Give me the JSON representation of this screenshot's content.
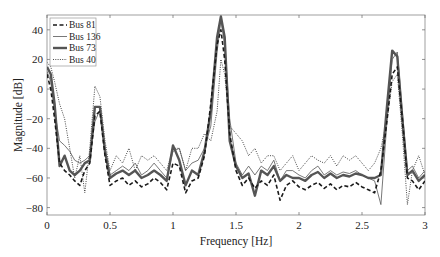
{
  "chart_data": {
    "type": "line",
    "title": "",
    "xlabel": "Frequency [Hz]",
    "ylabel": "Magnitude [dB]",
    "xlim": [
      0,
      3
    ],
    "ylim": [
      -85,
      50
    ],
    "xticks": [
      0,
      0.5,
      1,
      1.5,
      2,
      2.5,
      3
    ],
    "xtick_labels": [
      "0",
      "0.5",
      "1",
      "1.5",
      "2",
      "2.5",
      "3"
    ],
    "yticks": [
      40,
      20,
      0,
      -20,
      -40,
      -60,
      -80
    ],
    "ytick_labels": [
      "40",
      "20",
      "0",
      "-20",
      "-40",
      "-60",
      "-80"
    ],
    "grid": false,
    "legend_position": "upper left",
    "series": [
      {
        "name": "Bus 81",
        "style": "dashed",
        "color": "#1a1a1a",
        "x": [
          0,
          0.03,
          0.06,
          0.1,
          0.14,
          0.18,
          0.22,
          0.26,
          0.3,
          0.34,
          0.38,
          0.42,
          0.46,
          0.5,
          0.55,
          0.6,
          0.65,
          0.7,
          0.75,
          0.8,
          0.85,
          0.9,
          0.95,
          1.0,
          1.05,
          1.1,
          1.15,
          1.2,
          1.25,
          1.3,
          1.35,
          1.38,
          1.41,
          1.45,
          1.5,
          1.55,
          1.6,
          1.65,
          1.7,
          1.75,
          1.8,
          1.85,
          1.9,
          1.95,
          2.0,
          2.05,
          2.1,
          2.15,
          2.2,
          2.25,
          2.3,
          2.35,
          2.4,
          2.45,
          2.5,
          2.55,
          2.6,
          2.65,
          2.7,
          2.74,
          2.78,
          2.82,
          2.86,
          2.9,
          2.95,
          3.0
        ],
        "values": [
          10,
          0,
          -20,
          -50,
          -55,
          -58,
          -62,
          -65,
          -55,
          -50,
          -18,
          -15,
          -45,
          -65,
          -62,
          -60,
          -65,
          -62,
          -66,
          -64,
          -60,
          -63,
          -68,
          -50,
          -52,
          -70,
          -62,
          -60,
          -45,
          -10,
          30,
          40,
          20,
          -30,
          -55,
          -65,
          -60,
          -67,
          -62,
          -65,
          -58,
          -75,
          -65,
          -62,
          -66,
          -68,
          -65,
          -63,
          -67,
          -64,
          -68,
          -65,
          -66,
          -63,
          -66,
          -68,
          -70,
          -55,
          -20,
          10,
          15,
          -20,
          -60,
          -62,
          -68,
          -62
        ]
      },
      {
        "name": "Bus 136",
        "style": "solid-thin",
        "color": "#555555",
        "x": [
          0,
          0.03,
          0.06,
          0.1,
          0.14,
          0.18,
          0.22,
          0.26,
          0.3,
          0.34,
          0.38,
          0.42,
          0.46,
          0.5,
          0.55,
          0.6,
          0.65,
          0.7,
          0.75,
          0.8,
          0.85,
          0.9,
          0.95,
          1.0,
          1.05,
          1.1,
          1.15,
          1.2,
          1.25,
          1.3,
          1.35,
          1.38,
          1.41,
          1.45,
          1.5,
          1.55,
          1.6,
          1.65,
          1.7,
          1.75,
          1.8,
          1.85,
          1.9,
          1.95,
          2.0,
          2.05,
          2.1,
          2.15,
          2.2,
          2.25,
          2.3,
          2.35,
          2.4,
          2.45,
          2.5,
          2.55,
          2.6,
          2.65,
          2.7,
          2.74,
          2.78,
          2.82,
          2.86,
          2.9,
          2.95,
          3.0
        ],
        "values": [
          12,
          5,
          -15,
          -35,
          -38,
          -42,
          -48,
          -50,
          -48,
          -45,
          -22,
          -14,
          -40,
          -58,
          -55,
          -52,
          -55,
          -50,
          -58,
          -55,
          -50,
          -55,
          -60,
          -42,
          -40,
          -55,
          -50,
          -48,
          -40,
          -25,
          25,
          47,
          30,
          -20,
          -50,
          -58,
          -52,
          -58,
          -52,
          -55,
          -48,
          -62,
          -55,
          -55,
          -58,
          -60,
          -55,
          -52,
          -58,
          -55,
          -58,
          -56,
          -57,
          -55,
          -58,
          -60,
          -62,
          -78,
          -20,
          20,
          25,
          -15,
          -55,
          -52,
          -60,
          -55
        ]
      },
      {
        "name": "Bus 73",
        "style": "solid-thick",
        "color": "#555555",
        "x": [
          0,
          0.03,
          0.06,
          0.1,
          0.14,
          0.18,
          0.22,
          0.26,
          0.3,
          0.34,
          0.38,
          0.42,
          0.46,
          0.5,
          0.55,
          0.6,
          0.65,
          0.7,
          0.75,
          0.8,
          0.85,
          0.9,
          0.95,
          1.0,
          1.05,
          1.1,
          1.15,
          1.2,
          1.25,
          1.3,
          1.35,
          1.38,
          1.41,
          1.45,
          1.5,
          1.55,
          1.6,
          1.65,
          1.7,
          1.75,
          1.8,
          1.85,
          1.9,
          1.95,
          2.0,
          2.05,
          2.1,
          2.15,
          2.2,
          2.25,
          2.3,
          2.35,
          2.4,
          2.45,
          2.5,
          2.55,
          2.6,
          2.65,
          2.7,
          2.74,
          2.78,
          2.82,
          2.86,
          2.9,
          2.95,
          3.0
        ],
        "values": [
          15,
          10,
          -10,
          -52,
          -45,
          -55,
          -58,
          -55,
          -50,
          -48,
          -12,
          -12,
          -42,
          -60,
          -57,
          -55,
          -58,
          -55,
          -60,
          -58,
          -55,
          -58,
          -62,
          -38,
          -48,
          -65,
          -55,
          -58,
          -42,
          -15,
          35,
          49,
          35,
          -35,
          -52,
          -60,
          -57,
          -72,
          -55,
          -58,
          -52,
          -62,
          -58,
          -60,
          -60,
          -62,
          -58,
          -56,
          -60,
          -57,
          -60,
          -58,
          -59,
          -57,
          -58,
          -60,
          -60,
          -58,
          -10,
          26,
          22,
          -20,
          -58,
          -55,
          -62,
          -58
        ]
      },
      {
        "name": "Bus 40",
        "style": "dotted",
        "color": "#333333",
        "x": [
          0,
          0.03,
          0.06,
          0.1,
          0.14,
          0.18,
          0.22,
          0.26,
          0.3,
          0.34,
          0.38,
          0.42,
          0.46,
          0.5,
          0.55,
          0.6,
          0.65,
          0.7,
          0.75,
          0.8,
          0.85,
          0.9,
          0.95,
          1.0,
          1.05,
          1.1,
          1.15,
          1.2,
          1.25,
          1.3,
          1.35,
          1.38,
          1.41,
          1.45,
          1.5,
          1.55,
          1.6,
          1.65,
          1.7,
          1.75,
          1.8,
          1.85,
          1.9,
          1.95,
          2.0,
          2.05,
          2.1,
          2.15,
          2.2,
          2.25,
          2.3,
          2.35,
          2.4,
          2.45,
          2.5,
          2.55,
          2.6,
          2.65,
          2.7,
          2.74,
          2.78,
          2.82,
          2.86,
          2.9,
          2.95,
          3.0
        ],
        "values": [
          18,
          15,
          5,
          -10,
          -20,
          -40,
          -60,
          -45,
          -70,
          -40,
          2,
          -5,
          -35,
          -55,
          -45,
          -50,
          -40,
          -55,
          -45,
          -48,
          -45,
          -50,
          -55,
          -40,
          -40,
          -55,
          -40,
          -40,
          -30,
          -35,
          -15,
          20,
          10,
          -25,
          -30,
          -35,
          -45,
          -40,
          -50,
          -45,
          -45,
          -55,
          -50,
          -45,
          -55,
          -50,
          -45,
          -48,
          -50,
          -45,
          -52,
          -45,
          -48,
          -45,
          -50,
          -55,
          -50,
          -40,
          -20,
          5,
          10,
          -30,
          -78,
          -55,
          -45,
          -58
        ]
      }
    ]
  }
}
